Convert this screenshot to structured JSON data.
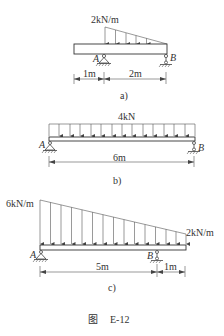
{
  "figure": {
    "caption_prefix": "图",
    "caption_id": "E-12",
    "panels": [
      {
        "id": "a",
        "label": "a)",
        "load": {
          "type": "triangular",
          "max_label": "2kN/m",
          "max_value_kN_per_m": 2,
          "min_value_kN_per_m": 0
        },
        "supports": [
          {
            "name": "A",
            "type": "pin"
          },
          {
            "name": "B",
            "type": "roller"
          }
        ],
        "dimensions": [
          {
            "label": "1m"
          },
          {
            "label": "2m"
          }
        ]
      },
      {
        "id": "b",
        "label": "b)",
        "load": {
          "type": "uniform",
          "label": "4kN"
        },
        "supports": [
          {
            "name": "A",
            "type": "pin"
          },
          {
            "name": "B",
            "type": "roller"
          }
        ],
        "dimensions": [
          {
            "label": "6m"
          }
        ]
      },
      {
        "id": "c",
        "label": "c)",
        "load": {
          "type": "trapezoidal",
          "left_label": "6kN/m",
          "right_label": "2kN/m",
          "left_value_kN_per_m": 6,
          "right_value_kN_per_m": 2
        },
        "supports": [
          {
            "name": "A",
            "type": "pin"
          },
          {
            "name": "B",
            "type": "roller"
          }
        ],
        "dimensions": [
          {
            "label": "5m"
          },
          {
            "label": "1m"
          }
        ]
      }
    ]
  }
}
